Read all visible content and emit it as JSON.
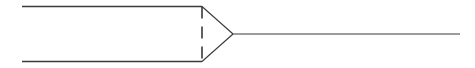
{
  "diagram": {
    "type": "probe-tip-schematic",
    "stroke_color": "#3a3a3a",
    "background": "#ffffff",
    "top_line": {
      "x1": 22,
      "y1": 6.5,
      "x2": 202,
      "y2": 6.5
    },
    "bottom_line": {
      "x1": 22,
      "y1": 61.5,
      "x2": 202,
      "y2": 61.5
    },
    "dashed_line": {
      "x1": 202,
      "y1": 6.5,
      "x2": 202,
      "y2": 61.5,
      "dash": "12 8"
    },
    "cone_upper": {
      "x1": 202,
      "y1": 6.5,
      "x2": 233,
      "y2": 34
    },
    "cone_lower": {
      "x1": 202,
      "y1": 61.5,
      "x2": 233,
      "y2": 34
    },
    "tail_line": {
      "x1": 233,
      "y1": 34,
      "x2": 460,
      "y2": 34
    }
  }
}
